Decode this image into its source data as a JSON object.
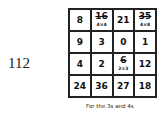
{
  "page_number": "112",
  "grid": {
    "rows": [
      [
        {
          "value": "8",
          "note": "",
          "struck": false
        },
        {
          "value": "16",
          "note": "4×4",
          "struck": true
        },
        {
          "value": "21",
          "note": "",
          "struck": false
        },
        {
          "value": "35",
          "note": "4×8",
          "struck": true
        }
      ],
      [
        {
          "value": "9",
          "note": "",
          "struck": false
        },
        {
          "value": "3",
          "note": "",
          "struck": false
        },
        {
          "value": "0",
          "note": "",
          "struck": false
        },
        {
          "value": "1",
          "note": "",
          "struck": false
        }
      ],
      [
        {
          "value": "4",
          "note": "",
          "struck": false
        },
        {
          "value": "2",
          "note": "",
          "struck": false
        },
        {
          "value": "6",
          "note": "2×3",
          "struck": true
        },
        {
          "value": "12",
          "note": "",
          "struck": false
        }
      ],
      [
        {
          "value": "24",
          "note": "",
          "struck": false
        },
        {
          "value": "36",
          "note": "",
          "struck": false
        },
        {
          "value": "27",
          "note": "",
          "struck": false
        },
        {
          "value": "18",
          "note": "",
          "struck": false
        }
      ]
    ]
  },
  "caption": "For the 3s and 4s"
}
